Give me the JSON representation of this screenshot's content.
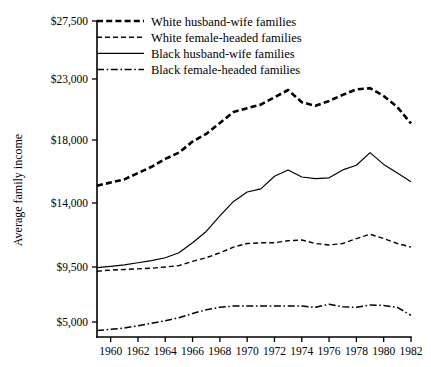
{
  "chart_data": {
    "type": "line",
    "title": "",
    "subtitle": "",
    "xlabel": "",
    "ylabel": "Average family income",
    "xlim": [
      1959,
      1982
    ],
    "ylim": [
      3500,
      27500
    ],
    "grid": false,
    "legend_position": "top-center",
    "x": [
      1959,
      1960,
      1961,
      1962,
      1963,
      1964,
      1965,
      1966,
      1967,
      1968,
      1969,
      1970,
      1971,
      1972,
      1973,
      1974,
      1975,
      1976,
      1977,
      1978,
      1979,
      1980,
      1981,
      1982
    ],
    "xticks": [
      1960,
      1962,
      1964,
      1966,
      1968,
      1970,
      1972,
      1974,
      1976,
      1978,
      1980,
      1982
    ],
    "xtick_labels": [
      "1960",
      "1962",
      "1964",
      "1966",
      "1968",
      "1970",
      "1972",
      "1974",
      "1976",
      "1978",
      "1980",
      "1982"
    ],
    "yticks": [
      5000,
      9500,
      14000,
      18000,
      23000,
      27500
    ],
    "ytick_labels": [
      "$5,000",
      "$9,500",
      "$14,000",
      "$18,000",
      "$23,000",
      "$27,500"
    ],
    "series": [
      {
        "name": "White husband-wife families",
        "style": "thick-dashed",
        "values": [
          15100,
          15300,
          15500,
          15900,
          16300,
          16800,
          17200,
          17900,
          18500,
          19400,
          20300,
          20600,
          20900,
          21500,
          22100,
          21100,
          20800,
          21200,
          21700,
          22150,
          22250,
          21600,
          20700,
          19350
        ]
      },
      {
        "name": "White female-headed families",
        "style": "thin-dashed",
        "values": [
          9150,
          9250,
          9300,
          9350,
          9400,
          9500,
          9600,
          9900,
          10150,
          10500,
          10900,
          11150,
          11200,
          11200,
          11350,
          11400,
          11150,
          11050,
          11150,
          11500,
          11800,
          11500,
          11150,
          10900
        ]
      },
      {
        "name": "Black husband-wife families",
        "style": "solid",
        "values": [
          9450,
          9550,
          9650,
          9800,
          9950,
          10150,
          10500,
          11200,
          12000,
          13100,
          14100,
          14700,
          14900,
          15700,
          16100,
          15650,
          15550,
          15600,
          16100,
          16400,
          17200,
          16450,
          15900,
          15350
        ]
      },
      {
        "name": "Black female-headed families",
        "style": "dash-dot",
        "values": [
          4300,
          4400,
          4500,
          4700,
          4900,
          5100,
          5350,
          5700,
          6000,
          6200,
          6300,
          6300,
          6300,
          6300,
          6300,
          6300,
          6200,
          6450,
          6250,
          6200,
          6400,
          6350,
          6200,
          5550
        ]
      }
    ]
  },
  "legend": {
    "items": [
      {
        "label": "White husband-wife families",
        "style": "thick-dashed"
      },
      {
        "label": "White female-headed families",
        "style": "thin-dashed"
      },
      {
        "label": "Black husband-wife families",
        "style": "solid"
      },
      {
        "label": "Black female-headed families",
        "style": "dash-dot"
      }
    ]
  },
  "axes": {
    "y_title": "Average family income"
  },
  "colors": {
    "ink": "#000000",
    "background": "#ffffff"
  }
}
